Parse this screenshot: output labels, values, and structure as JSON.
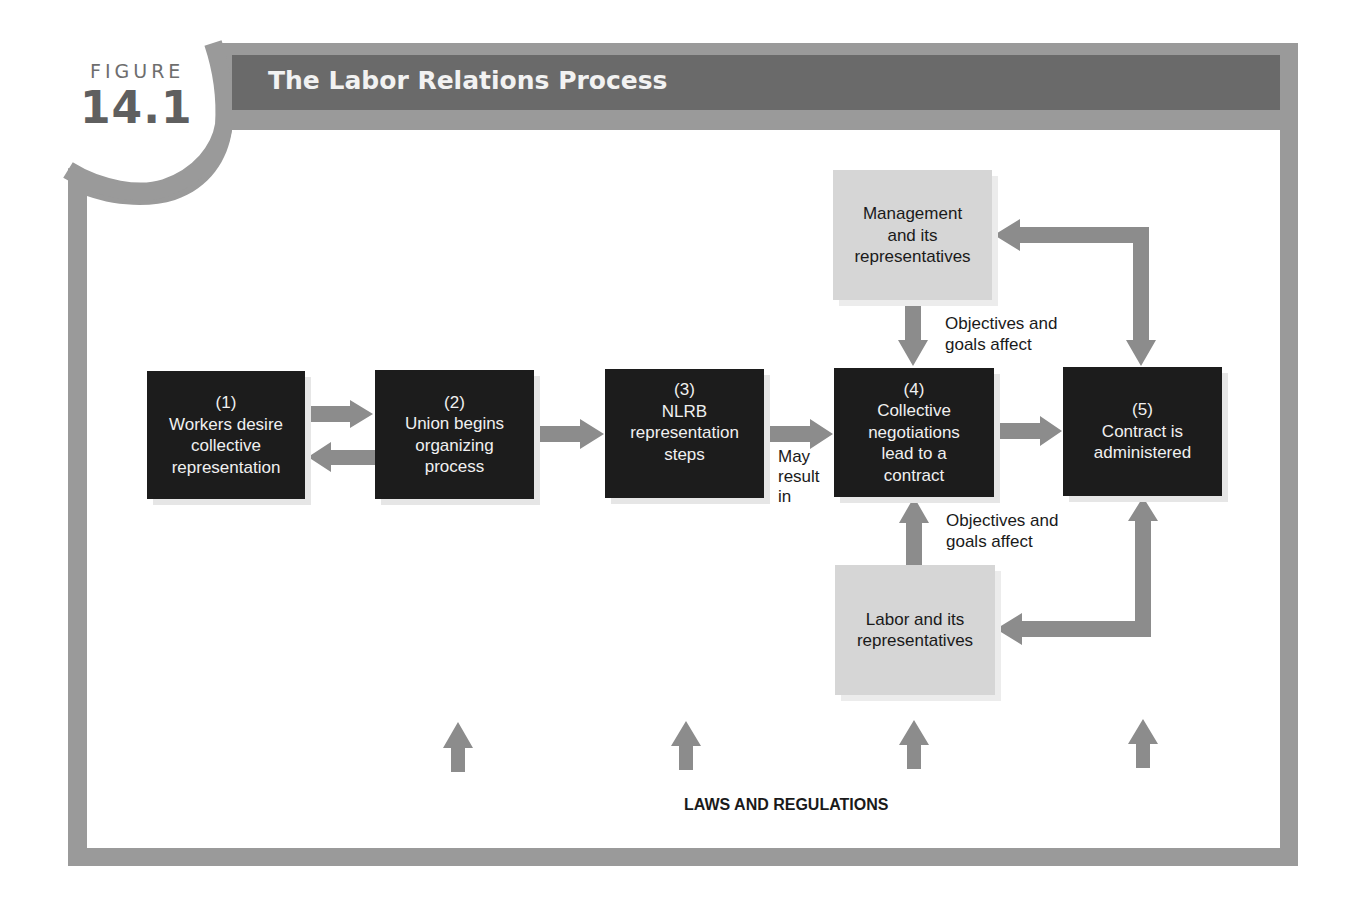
{
  "figure": {
    "label": "FIGURE",
    "number": "14.1",
    "title": "The Labor Relations Process"
  },
  "colors": {
    "frame": "#9a9a9a",
    "title_bar": "#6a6a6a",
    "dark_box": "#1c1c1c",
    "light_box": "#d6d6d6",
    "arrow": "#8c8c8c"
  },
  "process_steps": [
    {
      "number": "(1)",
      "lines": [
        "Workers desire",
        "collective",
        "representation"
      ]
    },
    {
      "number": "(2)",
      "lines": [
        "Union begins",
        "organizing",
        "process"
      ]
    },
    {
      "number": "(3)",
      "lines": [
        "NLRB",
        "representation",
        "steps"
      ]
    },
    {
      "number": "(4)",
      "lines": [
        "Collective",
        "negotiations",
        "lead to a",
        "contract"
      ]
    },
    {
      "number": "(5)",
      "lines": [
        "Contract is",
        "administered"
      ]
    }
  ],
  "parties": {
    "management": {
      "lines": [
        "Management",
        "and its",
        "representatives"
      ]
    },
    "labor": {
      "lines": [
        "Labor and its",
        "representatives"
      ]
    }
  },
  "annotations": {
    "may_result_in": [
      "May",
      "result",
      "in"
    ],
    "objectives_top": [
      "Objectives and",
      "goals affect"
    ],
    "objectives_bottom": [
      "Objectives and",
      "goals affect"
    ],
    "laws": "LAWS AND REGULATIONS"
  }
}
